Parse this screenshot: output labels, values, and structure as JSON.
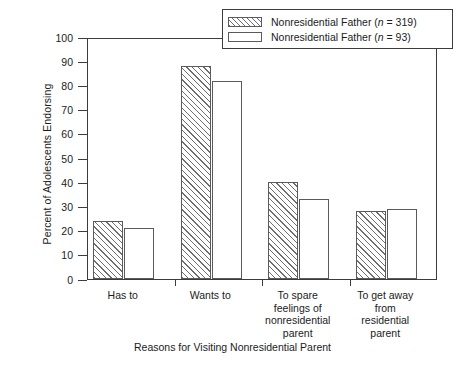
{
  "chart_data": {
    "type": "bar",
    "title": "",
    "xlabel": "Reasons for Visiting Nonresidential Parent",
    "ylabel": "Percent of Adolescents Endorsing",
    "ylim": [
      0,
      100
    ],
    "ytick_labels": [
      "0",
      "10",
      "20",
      "30",
      "40",
      "50",
      "60",
      "70",
      "80",
      "90",
      "100"
    ],
    "ytick_values": [
      0,
      10,
      20,
      30,
      40,
      50,
      60,
      70,
      80,
      90,
      100
    ],
    "grid": false,
    "legend_position": "top-right",
    "categories": [
      "Has to",
      "Wants to",
      "To spare feelings of nonresidential parent",
      "To get away from residential parent"
    ],
    "category_lines": [
      [
        "Has to"
      ],
      [
        "Wants to"
      ],
      [
        "To spare",
        "feelings of",
        "nonresidential",
        "parent"
      ],
      [
        "To get away",
        "from",
        "residential",
        "parent"
      ]
    ],
    "series": [
      {
        "name": "Nonresidential Father (n = 319)",
        "name_prefix": "Nonresidential Father (",
        "name_italic": "n",
        "name_suffix": " = 319)",
        "fill": "hatch",
        "values": [
          24,
          88,
          40,
          28
        ]
      },
      {
        "name": "Nonresidential Father (n = 93)",
        "name_prefix": "Nonresidential Father (",
        "name_italic": "n",
        "name_suffix": " = 93)",
        "fill": "plain",
        "values": [
          21,
          82,
          33,
          29
        ]
      }
    ]
  },
  "colors": {
    "axis": "#3c3c3c",
    "bar_edge": "#5a5a5a",
    "hatch": "#6e6e6e",
    "background": "#ffffff"
  }
}
